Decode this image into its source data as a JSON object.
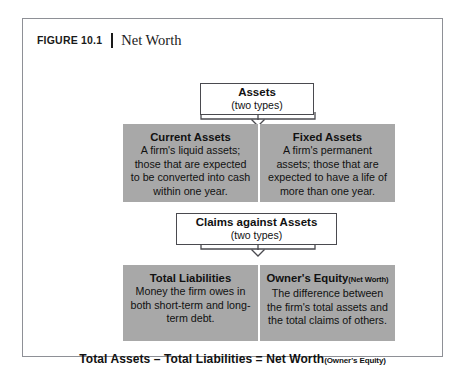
{
  "figure": {
    "label": "FIGURE 10.1",
    "title": "Net Worth"
  },
  "nodes": {
    "assets": {
      "title": "Assets",
      "subtitle": "(two types)"
    },
    "claims": {
      "title": "Claims against Assets",
      "subtitle": "(two types)"
    }
  },
  "asset_types": [
    {
      "title": "Current Assets",
      "body": "A firm's liquid assets; those that are expected to be converted into cash within one year."
    },
    {
      "title": "Fixed Assets",
      "body": "A firm's permanent assets; those that are expected to have a life of more than one year."
    }
  ],
  "claim_types": [
    {
      "title": "Total Liabilities",
      "title_note": "",
      "body": "Money the firm owes in both short-term and long-term debt."
    },
    {
      "title": "Owner's Equity",
      "title_note": "(Net Worth)",
      "body": "The difference between the firm's total assets and the total claims of others."
    }
  ],
  "equation": {
    "main": "Total Assets – Total Liabilities = Net Worth",
    "note": "(Owner's Equity)"
  },
  "colors": {
    "band_gray": "#a8a8a8",
    "frame_border": "#8e9096",
    "box_border": "#4a4a4f",
    "text": "#111111"
  }
}
